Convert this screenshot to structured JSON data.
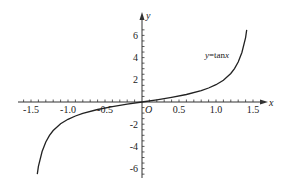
{
  "chart_data": {
    "type": "line",
    "title": "",
    "curve_label": "y=tanx",
    "curve_label_parts": {
      "var": "y",
      "eq": "=tan",
      "arg": "x"
    },
    "xlabel": "x",
    "ylabel": "y",
    "origin_label": "O",
    "xlim": [
      -1.5,
      1.5
    ],
    "ylim": [
      -6.5,
      6.5
    ],
    "x_ticks": [
      -1.5,
      -1.0,
      -0.5,
      0.5,
      1.0,
      1.5
    ],
    "x_tick_labels": [
      "-1.5",
      "-1.0",
      "-0.5",
      "0.5",
      "1.0",
      "1.5"
    ],
    "y_ticks": [
      -6,
      -4,
      -2,
      2,
      4,
      6
    ],
    "y_tick_labels": [
      "-6",
      "-4",
      "-2",
      "2",
      "4",
      "6"
    ],
    "x_minor_step": 0.1,
    "y_minor_step": 0.5,
    "grid": false,
    "series": [
      {
        "name": "y=tanx",
        "x": [
          -1.415,
          -1.4,
          -1.35,
          -1.3,
          -1.25,
          -1.2,
          -1.1,
          -1.0,
          -0.9,
          -0.8,
          -0.6,
          -0.4,
          -0.2,
          0.0,
          0.2,
          0.4,
          0.6,
          0.8,
          0.9,
          1.0,
          1.1,
          1.2,
          1.25,
          1.3,
          1.35,
          1.4,
          1.415
        ],
        "y": [
          -6.5,
          -5.8,
          -4.46,
          -3.6,
          -3.01,
          -2.57,
          -1.96,
          -1.56,
          -1.26,
          -1.03,
          -0.68,
          -0.42,
          -0.2,
          0.0,
          0.2,
          0.42,
          0.68,
          1.03,
          1.26,
          1.56,
          1.96,
          2.57,
          3.01,
          3.6,
          4.46,
          5.8,
          6.5
        ]
      }
    ]
  },
  "colors": {
    "axis": "#333333",
    "curve": "#222222",
    "background": "#ffffff"
  }
}
